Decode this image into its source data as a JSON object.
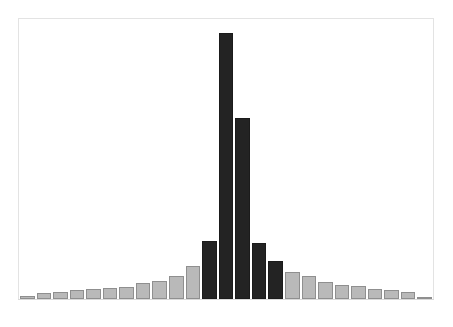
{
  "figure": {
    "background_color": "#ffffff",
    "frame_color": "#e3e3e3"
  },
  "chart_data": {
    "type": "bar",
    "title": "",
    "subtitle": "",
    "xlabel": "",
    "ylabel": "",
    "legend": [],
    "legend_position": "none",
    "grid": false,
    "axis_ticks_visible": false,
    "tick_labels_visible": false,
    "xlim": [
      0,
      25
    ],
    "ylim": [
      0,
      100
    ],
    "bar_gap_px": 2,
    "colors": {
      "light_fill": "#b9b9b9",
      "light_edge": "#8f8f8f",
      "dark_fill": "#232323",
      "dark_edge": "#1b1b1b"
    },
    "categories": [
      "1",
      "2",
      "3",
      "4",
      "5",
      "6",
      "7",
      "8",
      "9",
      "10",
      "11",
      "12",
      "13",
      "14",
      "15",
      "16",
      "17",
      "18",
      "19",
      "20",
      "21",
      "22",
      "23",
      "24",
      "25"
    ],
    "values": [
      1.1,
      2.2,
      2.5,
      3.2,
      3.6,
      4.0,
      4.3,
      5.7,
      6.4,
      8.2,
      11.8,
      20.8,
      95.0,
      64.5,
      20.0,
      13.5,
      9.6,
      8.3,
      6.2,
      5.0,
      4.6,
      3.4,
      3.2,
      2.5,
      0.7
    ],
    "series": [
      {
        "name": "distribution",
        "values": [
          1.1,
          2.2,
          2.5,
          3.2,
          3.6,
          4.0,
          4.3,
          5.7,
          6.4,
          8.2,
          11.8,
          20.8,
          95.0,
          64.5,
          20.0,
          13.5,
          9.6,
          8.3,
          6.2,
          5.0,
          4.6,
          3.4,
          3.2,
          2.5,
          0.7
        ],
        "bar_styles": [
          "light",
          "light",
          "light",
          "light",
          "light",
          "light",
          "light",
          "light",
          "light",
          "light",
          "light",
          "dark",
          "dark",
          "dark",
          "dark",
          "dark",
          "light",
          "light",
          "light",
          "light",
          "light",
          "light",
          "light",
          "light",
          "light"
        ]
      }
    ],
    "highlighted_indices": [
      11,
      12,
      13,
      14,
      15
    ],
    "peak_index": 12,
    "peak_value": 95.0
  }
}
